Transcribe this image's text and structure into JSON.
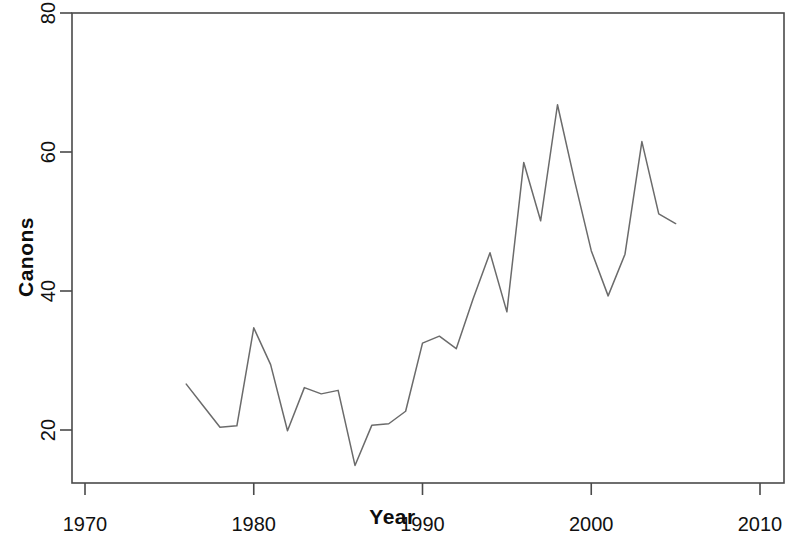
{
  "chart_data": {
    "type": "line",
    "title": "",
    "xlabel": "Year",
    "ylabel": "Canons",
    "xlim": [
      1967,
      2012
    ],
    "ylim": [
      13,
      81
    ],
    "xticks": [
      1970,
      1980,
      1990,
      2000,
      2010
    ],
    "yticks": [
      20,
      40,
      60,
      80
    ],
    "xtick_labels": [
      "1970",
      "1980",
      "1990",
      "2000",
      "2010"
    ],
    "ytick_labels": [
      "20",
      "40",
      "60",
      "80"
    ],
    "grid": false,
    "legend": null,
    "line_color": "#6b6b6b",
    "series": [
      {
        "name": "Canons",
        "x": [
          1976,
          1977,
          1978,
          1979,
          1980,
          1981,
          1982,
          1983,
          1984,
          1985,
          1986,
          1987,
          1988,
          1989,
          1990,
          1991,
          1992,
          1993,
          1994,
          1995,
          1996,
          1997,
          1998,
          1999,
          2000,
          2001,
          2002,
          2003,
          2004,
          2005
        ],
        "values": [
          26.6,
          23.5,
          20.4,
          20.6,
          34.7,
          29.4,
          19.9,
          26.1,
          25.2,
          25.7,
          14.9,
          20.7,
          20.9,
          22.7,
          32.5,
          33.5,
          31.7,
          38.9,
          45.5,
          37.0,
          58.5,
          50.1,
          66.8,
          56.0,
          45.8,
          39.3,
          45.3,
          61.5,
          51.1,
          49.7
        ]
      }
    ]
  },
  "axes": {
    "x_title": "Year",
    "y_title": "Canons"
  }
}
